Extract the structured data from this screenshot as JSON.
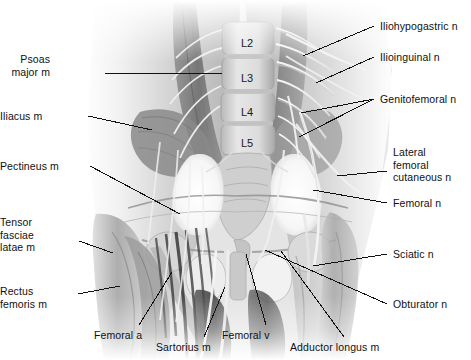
{
  "figure": {
    "background_color": "#ffffff",
    "width": 471,
    "height": 360,
    "style": "grayscale anatomical illustration"
  },
  "vertebrae": [
    {
      "label": "L2",
      "x": 247,
      "y": 38
    },
    {
      "label": "L3",
      "x": 247,
      "y": 73
    },
    {
      "label": "L4",
      "x": 247,
      "y": 107
    },
    {
      "label": "L5",
      "x": 247,
      "y": 138
    }
  ],
  "labels": [
    {
      "name": "psoas-major-m",
      "text": "Psoas\nmajor m",
      "align": "right",
      "x": 50,
      "y": 53,
      "anchor_x": 105,
      "anchor_y": 73,
      "tip_x": 222,
      "tip_y": 73
    },
    {
      "name": "iliacus-m",
      "text": "Iliacus m",
      "align": "right",
      "x": 33,
      "y": 110,
      "anchor_x": 88,
      "anchor_y": 116,
      "tip_x": 152,
      "tip_y": 130
    },
    {
      "name": "pectineus-m",
      "text": "Pectineus m",
      "align": "right",
      "x": 19,
      "y": 160,
      "anchor_x": 90,
      "anchor_y": 166,
      "tip_x": 180,
      "tip_y": 214
    },
    {
      "name": "tensor-fasciae-latae-m",
      "text": "Tensor\nfasciae\nlatae m",
      "align": "right",
      "x": 28,
      "y": 216,
      "anchor_x": 79,
      "anchor_y": 241,
      "tip_x": 113,
      "tip_y": 253
    },
    {
      "name": "rectus-femoris-m",
      "text": "Rectus\nfemoris m",
      "align": "right",
      "x": 21,
      "y": 285,
      "anchor_x": 78,
      "anchor_y": 294,
      "tip_x": 120,
      "tip_y": 286
    },
    {
      "name": "femoral-a",
      "text": "Femoral a",
      "align": "center",
      "x": 94,
      "y": 329,
      "anchor_x": 139,
      "anchor_y": 325,
      "tip_x": 172,
      "tip_y": 272
    },
    {
      "name": "sartorius-m",
      "text": "Sartorius m",
      "align": "center",
      "x": 156,
      "y": 341,
      "anchor_x": 204,
      "anchor_y": 337,
      "tip_x": 225,
      "tip_y": 287
    },
    {
      "name": "femoral-v",
      "text": "Femoral v",
      "align": "center",
      "x": 222,
      "y": 329,
      "anchor_x": 266,
      "anchor_y": 325,
      "tip_x": 246,
      "tip_y": 254
    },
    {
      "name": "adductor-longus-m",
      "text": "Adductor longus m",
      "align": "center",
      "x": 290,
      "y": 341,
      "anchor_x": 344,
      "anchor_y": 337,
      "tip_x": 281,
      "tip_y": 251
    },
    {
      "name": "iliohypogastric-n",
      "text": "Iliohypogastric n",
      "align": "left",
      "x": 380,
      "y": 20,
      "anchor_x": 374,
      "anchor_y": 26,
      "tip_x": 303,
      "tip_y": 56
    },
    {
      "name": "ilioinguinal-n",
      "text": "Ilioinguinal n",
      "align": "left",
      "x": 380,
      "y": 51,
      "anchor_x": 374,
      "anchor_y": 57,
      "tip_x": 316,
      "tip_y": 83
    },
    {
      "name": "genitofemoral-n",
      "text": "Genitofemoral n",
      "align": "left",
      "x": 380,
      "y": 93,
      "anchor_x": 374,
      "anchor_y": 99,
      "tip_x": 301,
      "tip_y": 113,
      "tip2_x": 299,
      "tip2_y": 137
    },
    {
      "name": "lateral-femoral-cutaneous-n",
      "text": "Lateral\nfemoral\ncutaneous n",
      "align": "left",
      "x": 393,
      "y": 146,
      "anchor_x": 387,
      "anchor_y": 171,
      "tip_x": 337,
      "tip_y": 176
    },
    {
      "name": "femoral-n",
      "text": "Femoral n",
      "align": "left",
      "x": 393,
      "y": 197,
      "anchor_x": 387,
      "anchor_y": 203,
      "tip_x": 313,
      "tip_y": 190
    },
    {
      "name": "sciatic-n",
      "text": "Sciatic n",
      "align": "left",
      "x": 393,
      "y": 248,
      "anchor_x": 387,
      "anchor_y": 254,
      "tip_x": 313,
      "tip_y": 266
    },
    {
      "name": "obturator-n",
      "text": "Obturator n",
      "align": "left",
      "x": 393,
      "y": 298,
      "anchor_x": 387,
      "anchor_y": 304,
      "tip_x": 265,
      "tip_y": 250
    }
  ],
  "colors": {
    "text": "#101010",
    "leader_line": "#111111",
    "background": "#ffffff",
    "tissue_light": "#e8e8e8",
    "tissue_mid": "#b4b4b4",
    "tissue_dark": "#6e6e6e",
    "tissue_darkest": "#3c3c3c",
    "bone_highlight": "#fafafa"
  }
}
